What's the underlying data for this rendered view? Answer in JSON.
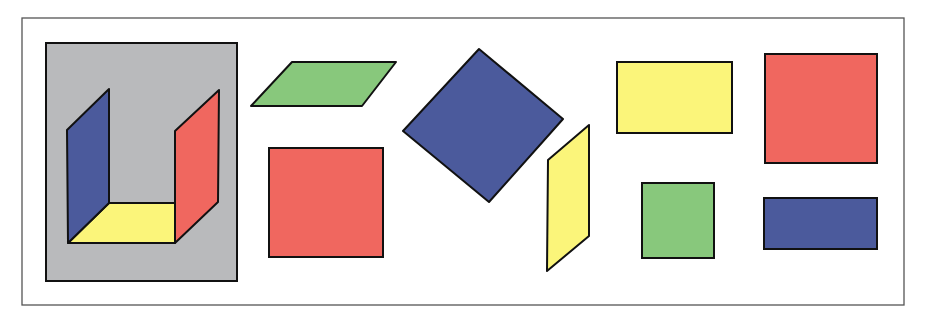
{
  "colors": {
    "background": "#ffffff",
    "frame": "#555555",
    "outline": "#111111",
    "gray": "#b9babc",
    "blue": "#4b5a9c",
    "red": "#f0675f",
    "yellow": "#fbf57a",
    "green": "#88c87c"
  },
  "figure": {
    "composite": {
      "label": "open-box-in-perspective",
      "faces": [
        "blue left wall",
        "yellow floor",
        "red right wall"
      ]
    },
    "shapes": [
      {
        "name": "green-parallelogram",
        "color": "green"
      },
      {
        "name": "red-square",
        "color": "red"
      },
      {
        "name": "blue-diamond",
        "color": "blue"
      },
      {
        "name": "yellow-parallelogram",
        "color": "yellow"
      },
      {
        "name": "yellow-rectangle",
        "color": "yellow"
      },
      {
        "name": "red-large-square",
        "color": "red"
      },
      {
        "name": "green-small-square",
        "color": "green"
      },
      {
        "name": "blue-rectangle",
        "color": "blue"
      }
    ]
  }
}
